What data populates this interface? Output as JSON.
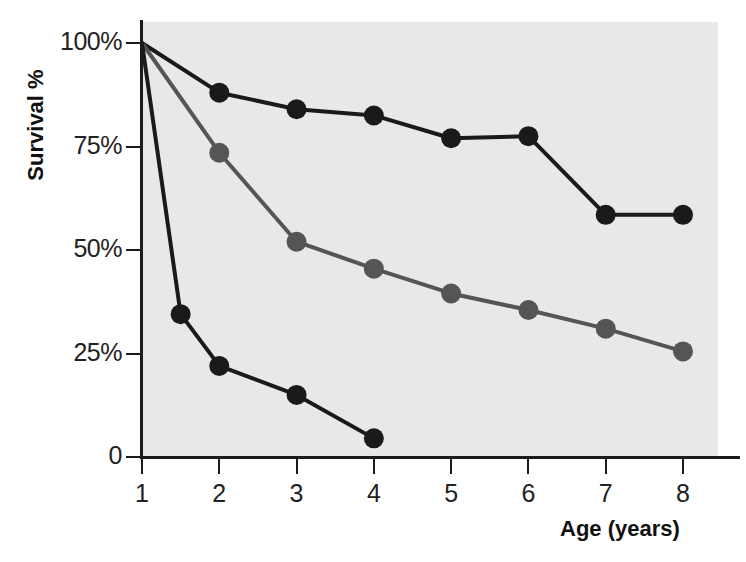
{
  "chart_data": {
    "type": "line",
    "title": "",
    "xlabel": "Age (years)",
    "ylabel": "Survival %",
    "xlim": [
      1,
      8
    ],
    "ylim": [
      0,
      100
    ],
    "x_ticks": [
      1,
      2,
      3,
      4,
      5,
      6,
      7,
      8
    ],
    "x_tick_labels": [
      "1",
      "2",
      "3",
      "4",
      "5",
      "6",
      "7",
      "8"
    ],
    "y_ticks": [
      0,
      25,
      50,
      75,
      100
    ],
    "y_tick_labels": [
      "0",
      "25%",
      "50%",
      "75%",
      "100%"
    ],
    "grid": false,
    "legend": "none",
    "plot_background": "#e8e8e8",
    "series": [
      {
        "name": "series-1-black-upper",
        "color": "#1a1a1a",
        "marker": "circle",
        "x": [
          1,
          2,
          3,
          4,
          5,
          6,
          7,
          8
        ],
        "values": [
          100,
          88,
          84,
          82.5,
          77,
          77.5,
          58.5,
          58.5
        ]
      },
      {
        "name": "series-2-gray-middle",
        "color": "#555555",
        "marker": "circle",
        "x": [
          1,
          2,
          3,
          4,
          5,
          6,
          7,
          8
        ],
        "values": [
          100,
          73.5,
          52,
          45.5,
          39.5,
          35.5,
          31,
          25.5
        ]
      },
      {
        "name": "series-3-black-steep",
        "color": "#1a1a1a",
        "marker": "circle",
        "x": [
          1,
          1.5,
          2,
          3,
          4
        ],
        "values": [
          100,
          34.5,
          22,
          15,
          4.5
        ]
      }
    ]
  },
  "axes": {
    "y_title": "Survival %",
    "x_title": "Age (years)"
  }
}
